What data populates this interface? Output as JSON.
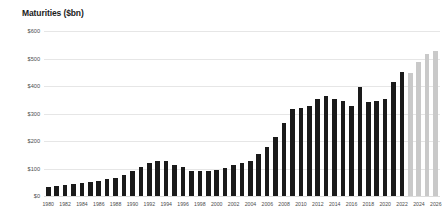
{
  "chart_data": {
    "type": "bar",
    "title": "Maturities ($bn)",
    "xlabel": "",
    "ylabel": "",
    "ylim": [
      0,
      600
    ],
    "ytick_values": [
      0,
      100,
      200,
      300,
      400,
      500,
      600
    ],
    "ytick_labels": [
      "$0",
      "$100",
      "$200",
      "$300",
      "$400",
      "$500",
      "$600"
    ],
    "grid": true,
    "legend": "none",
    "categories": [
      "1980",
      "1981",
      "1982",
      "1983",
      "1984",
      "1985",
      "1986",
      "1987",
      "1988",
      "1989",
      "1990",
      "1991",
      "1992",
      "1993",
      "1994",
      "1995",
      "1996",
      "1997",
      "1998",
      "1999",
      "2000",
      "2001",
      "2002",
      "2003",
      "2004",
      "2005",
      "2006",
      "2007",
      "2008",
      "2009",
      "2010",
      "2011",
      "2012",
      "2013",
      "2014",
      "2015",
      "2016",
      "2017",
      "2018",
      "2019",
      "2020",
      "2021",
      "2022",
      "2023",
      "2024",
      "2025",
      "2026"
    ],
    "xtick_labels": [
      "1980",
      "1982",
      "1984",
      "1986",
      "1988",
      "1990",
      "1992",
      "1994",
      "1996",
      "1998",
      "2000",
      "2002",
      "2004",
      "2006",
      "2008",
      "2010",
      "2012",
      "2014",
      "2016",
      "2018",
      "2020",
      "2022",
      "2024",
      "2026"
    ],
    "values": [
      31,
      37,
      40,
      44,
      49,
      51,
      55,
      61,
      65,
      77,
      90,
      106,
      120,
      128,
      127,
      113,
      105,
      92,
      91,
      92,
      93,
      101,
      111,
      120,
      126,
      153,
      178,
      213,
      265,
      315,
      320,
      327,
      353,
      363,
      351,
      347,
      328,
      397,
      342,
      347,
      354,
      414,
      452,
      447,
      487,
      515,
      527
    ],
    "series": [
      {
        "name": "Actual maturities",
        "color": "#1a1a1a",
        "range": [
          "1980",
          "2022"
        ]
      },
      {
        "name": "Projected maturities",
        "color": "#c9c9c9",
        "range": [
          "2023",
          "2026"
        ]
      }
    ],
    "forecast_start_category": "2023",
    "forecast_values": [
      447,
      487,
      515,
      527,
      545
    ]
  }
}
